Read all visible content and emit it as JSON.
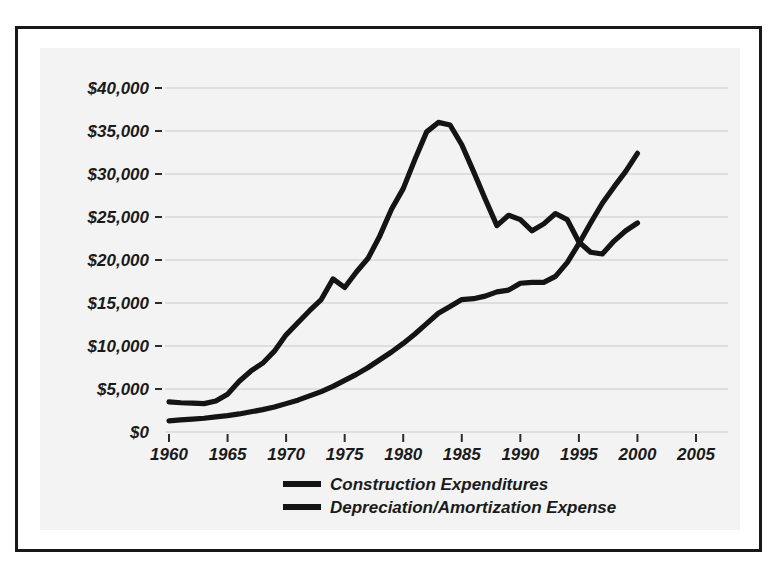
{
  "figure": {
    "background_color": "#ffffff",
    "panel_color": "#f3f3f3",
    "frame_color": "#17181a",
    "line_color": "#141414",
    "gridline_color": "#c9c9c9"
  },
  "chart_data": {
    "type": "line",
    "title": "",
    "subtitle": "",
    "xlabel": "",
    "ylabel": "",
    "xlim": [
      1958,
      2007
    ],
    "ylim": [
      0,
      42000
    ],
    "grid": true,
    "grid_axis": "y",
    "legend_position": "bottom-center",
    "x_tick_labels": [
      "1960",
      "1965",
      "1970",
      "1975",
      "1980",
      "1985",
      "1990",
      "1995",
      "2000",
      "2005"
    ],
    "x_tick_values": [
      1960,
      1965,
      1970,
      1975,
      1980,
      1985,
      1990,
      1995,
      2000,
      2005
    ],
    "y_tick_labels": [
      "$0",
      "$5,000",
      "$10,000",
      "$15,000",
      "$20,000",
      "$25,000",
      "$30,000",
      "$35,000",
      "$40,000"
    ],
    "y_tick_values": [
      0,
      5000,
      10000,
      15000,
      20000,
      25000,
      30000,
      35000,
      40000
    ],
    "series": [
      {
        "name": "Construction Expenditures",
        "x": [
          1960,
          1961,
          1962,
          1963,
          1964,
          1965,
          1966,
          1967,
          1968,
          1969,
          1970,
          1971,
          1972,
          1973,
          1974,
          1975,
          1976,
          1977,
          1978,
          1979,
          1980,
          1981,
          1982,
          1983,
          1984,
          1985,
          1986,
          1987,
          1988,
          1989,
          1990,
          1991,
          1992,
          1993,
          1994,
          1995,
          1996,
          1997,
          1998,
          1999,
          2000
        ],
        "values": [
          3500,
          3400,
          3350,
          3300,
          3600,
          4400,
          5900,
          7100,
          8000,
          9400,
          11300,
          12700,
          14100,
          15400,
          17800,
          16800,
          18600,
          20200,
          22800,
          25900,
          28300,
          31700,
          34900,
          36000,
          35700,
          33400,
          30300,
          27100,
          24000,
          25200,
          24700,
          23400,
          24200,
          25400,
          24700,
          22100,
          20900,
          20700,
          22200,
          23400,
          24300
        ]
      },
      {
        "name": "Depreciation/Amortization Expense",
        "x": [
          1960,
          1961,
          1962,
          1963,
          1964,
          1965,
          1966,
          1967,
          1968,
          1969,
          1970,
          1971,
          1972,
          1973,
          1974,
          1975,
          1976,
          1977,
          1978,
          1979,
          1980,
          1981,
          1982,
          1983,
          1984,
          1985,
          1986,
          1987,
          1988,
          1989,
          1990,
          1991,
          1992,
          1993,
          1994,
          1995,
          1996,
          1997,
          1998,
          1999,
          2000
        ],
        "values": [
          1300,
          1400,
          1500,
          1600,
          1750,
          1900,
          2100,
          2350,
          2600,
          2900,
          3300,
          3700,
          4200,
          4700,
          5300,
          6000,
          6700,
          7500,
          8400,
          9300,
          10300,
          11400,
          12600,
          13800,
          14600,
          15400,
          15500,
          15800,
          16300,
          16500,
          17300,
          17400,
          17400,
          18100,
          19700,
          21900,
          24300,
          26600,
          28500,
          30300,
          32400
        ]
      }
    ],
    "annotations": [
      {
        "text": "Construction peaks near $36,000 around 1983",
        "kind": "observation"
      },
      {
        "text": "Lines cross between 1995 and 1996",
        "kind": "observation"
      }
    ]
  },
  "legend": {
    "items": [
      {
        "label": "Construction Expenditures",
        "swatch": "thick-black-line"
      },
      {
        "label": "Depreciation/Amortization Expense",
        "swatch": "thick-black-line"
      }
    ]
  }
}
